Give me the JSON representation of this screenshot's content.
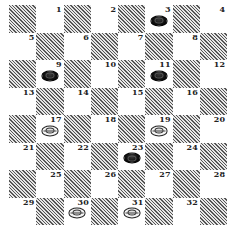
{
  "board": {
    "rows": 8,
    "cols": 8,
    "dark_color": "#555555",
    "light_color": "#ffffff",
    "playing_squares": "light",
    "squares": [
      {
        "num": "1",
        "row": 0,
        "col": 1,
        "piece": null
      },
      {
        "num": "2",
        "row": 0,
        "col": 3,
        "piece": null
      },
      {
        "num": "3",
        "row": 0,
        "col": 5,
        "piece": "black"
      },
      {
        "num": "4",
        "row": 0,
        "col": 7,
        "piece": null
      },
      {
        "num": "5",
        "row": 1,
        "col": 0,
        "piece": null
      },
      {
        "num": "6",
        "row": 1,
        "col": 2,
        "piece": null
      },
      {
        "num": "7",
        "row": 1,
        "col": 4,
        "piece": null
      },
      {
        "num": "8",
        "row": 1,
        "col": 6,
        "piece": null
      },
      {
        "num": "9",
        "row": 2,
        "col": 1,
        "piece": "black"
      },
      {
        "num": "10",
        "row": 2,
        "col": 3,
        "piece": null
      },
      {
        "num": "11",
        "row": 2,
        "col": 5,
        "piece": "black"
      },
      {
        "num": "12",
        "row": 2,
        "col": 7,
        "piece": null
      },
      {
        "num": "13",
        "row": 3,
        "col": 0,
        "piece": null
      },
      {
        "num": "14",
        "row": 3,
        "col": 2,
        "piece": null
      },
      {
        "num": "15",
        "row": 3,
        "col": 4,
        "piece": null
      },
      {
        "num": "16",
        "row": 3,
        "col": 6,
        "piece": null
      },
      {
        "num": "17",
        "row": 4,
        "col": 1,
        "piece": "white"
      },
      {
        "num": "18",
        "row": 4,
        "col": 3,
        "piece": null
      },
      {
        "num": "19",
        "row": 4,
        "col": 5,
        "piece": "white"
      },
      {
        "num": "20",
        "row": 4,
        "col": 7,
        "piece": null
      },
      {
        "num": "21",
        "row": 5,
        "col": 0,
        "piece": null
      },
      {
        "num": "22",
        "row": 5,
        "col": 2,
        "piece": null
      },
      {
        "num": "23",
        "row": 5,
        "col": 4,
        "piece": "black"
      },
      {
        "num": "24",
        "row": 5,
        "col": 6,
        "piece": null
      },
      {
        "num": "25",
        "row": 6,
        "col": 1,
        "piece": null
      },
      {
        "num": "26",
        "row": 6,
        "col": 3,
        "piece": null
      },
      {
        "num": "27",
        "row": 6,
        "col": 5,
        "piece": null
      },
      {
        "num": "28",
        "row": 6,
        "col": 7,
        "piece": null
      },
      {
        "num": "29",
        "row": 7,
        "col": 0,
        "piece": null
      },
      {
        "num": "30",
        "row": 7,
        "col": 2,
        "piece": "white"
      },
      {
        "num": "31",
        "row": 7,
        "col": 4,
        "piece": "white"
      },
      {
        "num": "32",
        "row": 7,
        "col": 6,
        "piece": null
      }
    ]
  },
  "pieces": {
    "black": [
      "3",
      "9",
      "11",
      "23"
    ],
    "white": [
      "17",
      "19",
      "30",
      "31"
    ]
  }
}
